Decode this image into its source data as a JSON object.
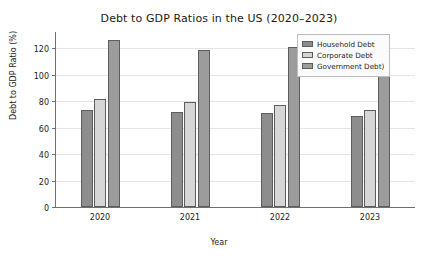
{
  "chart_data": {
    "type": "bar",
    "title": "Debt to GDP Ratios in the US (2020–2023)",
    "xlabel": "Year",
    "ylabel": "Debt to GDP Ratio (%)",
    "categories": [
      "2020",
      "2021",
      "2022",
      "2023"
    ],
    "ylim": [
      0,
      133
    ],
    "yticks": [
      0,
      20,
      40,
      60,
      80,
      100,
      120
    ],
    "ytick_labels": [
      "0",
      "20",
      "40",
      "60",
      "80",
      "100",
      "120"
    ],
    "grid": true,
    "legend_position": "upper right",
    "series": [
      {
        "name": "Household Debt",
        "color": "#8d8d8d",
        "values": [
          73,
          72,
          71,
          69
        ]
      },
      {
        "name": "Corporate Debt",
        "color": "#d6d6d6",
        "values": [
          82,
          79,
          77,
          73
        ]
      },
      {
        "name": "Government Debt)",
        "color": "#9c9c9c",
        "values": [
          126,
          119,
          121,
          120
        ]
      }
    ]
  },
  "colors": {
    "axis": "#6f6f6f",
    "grid": "#e4e4e4",
    "text": "#1b1b1b",
    "bar_edge": "#5d5d5d",
    "legend_border": "#bdbdbd",
    "legend_background": "#fbfbfb",
    "figure_background": "#ffffff"
  }
}
